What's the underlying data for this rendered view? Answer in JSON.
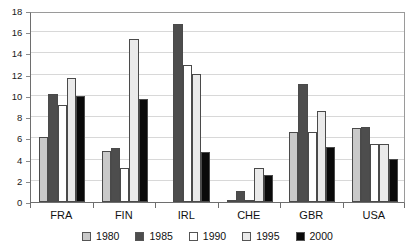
{
  "chart_data": {
    "type": "bar",
    "title": "",
    "subtitle": "",
    "xlabel": "",
    "ylabel": "",
    "ylim": [
      0,
      18
    ],
    "ytick_step": 2,
    "yticks": [
      0,
      2,
      4,
      6,
      8,
      10,
      12,
      14,
      16,
      18
    ],
    "grid": true,
    "grid_axis": "y",
    "legend_position": "bottom-center",
    "categories": [
      "FRA",
      "FIN",
      "IRL",
      "CHE",
      "GBR",
      "USA"
    ],
    "series": [
      {
        "name": "1980",
        "color": "#c9c9c9",
        "values": [
          6.1,
          4.8,
          0.0,
          0.2,
          6.6,
          7.0
        ]
      },
      {
        "name": "1985",
        "color": "#4d4d4d",
        "values": [
          10.2,
          5.1,
          16.8,
          1.0,
          11.1,
          7.1
        ]
      },
      {
        "name": "1990",
        "color": "#ffffff",
        "values": [
          9.1,
          3.2,
          12.9,
          0.05,
          6.6,
          5.5
        ]
      },
      {
        "name": "1995",
        "color": "#eaeaea",
        "values": [
          11.7,
          15.4,
          12.1,
          3.2,
          8.6,
          5.5
        ]
      },
      {
        "name": "2000",
        "color": "#0a0a0a",
        "values": [
          10.0,
          9.7,
          4.7,
          2.5,
          5.2,
          4.1
        ]
      }
    ]
  },
  "axes": {
    "y_tick_labels": [
      "0",
      "2",
      "4",
      "6",
      "8",
      "10",
      "12",
      "14",
      "16",
      "18"
    ],
    "x_tick_labels": [
      "FRA",
      "FIN",
      "IRL",
      "CHE",
      "GBR",
      "USA"
    ]
  },
  "legend": {
    "entries": [
      {
        "label": "1980",
        "color": "#c9c9c9"
      },
      {
        "label": "1985",
        "color": "#4d4d4d"
      },
      {
        "label": "1990",
        "color": "#ffffff"
      },
      {
        "label": "1995",
        "color": "#eaeaea"
      },
      {
        "label": "2000",
        "color": "#0a0a0a"
      }
    ]
  },
  "colors": {
    "background": "#ffffff",
    "gridline": "#d8d8d8",
    "axis": "#6e6e6e",
    "text": "#111111",
    "bar_outline": "#4a4a4a"
  }
}
